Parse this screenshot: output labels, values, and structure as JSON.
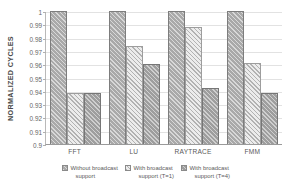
{
  "chart_data": {
    "type": "bar",
    "title": "",
    "xlabel": "",
    "ylabel": "NORMALIZED CYCLES",
    "categories": [
      "FFT",
      "LU",
      "RAYTRACE",
      "FMM"
    ],
    "ylim": [
      0.9,
      1.0
    ],
    "yticks": [
      "0.9",
      "0.91",
      "0.92",
      "0.93",
      "0.94",
      "0.95",
      "0.96",
      "0.97",
      "0.98",
      "0.99",
      "1"
    ],
    "grid": true,
    "legend_position": "bottom",
    "series": [
      {
        "name": "Without broadcast support",
        "values": [
          1.0,
          1.0,
          1.0,
          1.0
        ],
        "color": "#a9a9a9"
      },
      {
        "name": "With broadcast support (T=1)",
        "values": [
          0.938,
          0.974,
          0.988,
          0.961
        ],
        "color": "#ececec"
      },
      {
        "name": "With broadcast support (T=4)",
        "values": [
          0.938,
          0.96,
          0.942,
          0.938
        ],
        "color": "#9e9e9e"
      }
    ]
  },
  "legend": [
    {
      "line1": "Without broadcast",
      "line2": "support"
    },
    {
      "line1": "With broadcast",
      "line2": "support (T=1)"
    },
    {
      "line1": "With broadcast",
      "line2": "support (T=4)"
    }
  ]
}
